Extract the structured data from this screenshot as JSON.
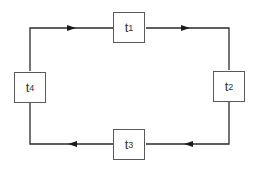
{
  "diagram": {
    "type": "cycle",
    "nodes": [
      {
        "id": "t1",
        "base": "t",
        "sub": "1",
        "position": "top"
      },
      {
        "id": "t2",
        "base": "t",
        "sub": "2",
        "position": "right"
      },
      {
        "id": "t3",
        "base": "t",
        "sub": "3",
        "position": "bottom"
      },
      {
        "id": "t4",
        "base": "t",
        "sub": "4",
        "position": "left"
      }
    ],
    "edges": [
      {
        "from": "t4",
        "to": "t1"
      },
      {
        "from": "t1",
        "to": "t2"
      },
      {
        "from": "t2",
        "to": "t3"
      },
      {
        "from": "t3",
        "to": "t4"
      }
    ],
    "direction": "clockwise",
    "colors": {
      "line": "#2a2a2a",
      "box_border": "#5a5a5a",
      "text": "#333333"
    }
  }
}
